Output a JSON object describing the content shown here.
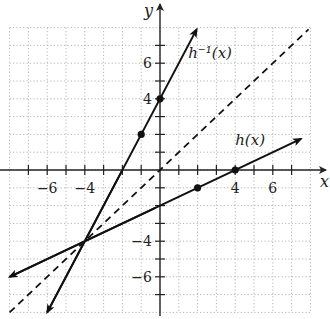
{
  "chart_data": {
    "type": "line",
    "title": "",
    "xlabel": "x",
    "ylabel": "y",
    "xlim": [
      -8,
      8
    ],
    "ylim": [
      -8,
      8
    ],
    "grid": true,
    "grid_style": "dotted",
    "x_ticks": [
      -6,
      -4,
      4,
      6
    ],
    "y_ticks": [
      6,
      4,
      -4,
      -6
    ],
    "series": [
      {
        "name": "h(x)",
        "label": "h(x)",
        "equation": "h(x) = x/2 - 2",
        "slope": 0.5,
        "intercept": -2,
        "style": "solid",
        "x_range": [
          -8,
          7.5
        ],
        "arrows": "both",
        "points": [
          {
            "x": 2,
            "y": -1
          },
          {
            "x": 4,
            "y": 0
          }
        ],
        "label_pos": {
          "x": 4,
          "y": 1.4
        }
      },
      {
        "name": "h^-1(x)",
        "label": "h⁻¹(x)",
        "equation": "h^-1(x) = 2x + 4",
        "slope": 2,
        "intercept": 4,
        "style": "solid",
        "x_range": [
          -6,
          1.95
        ],
        "arrows": "both",
        "points": [
          {
            "x": 0,
            "y": 4
          },
          {
            "x": -1,
            "y": 2
          }
        ],
        "label_pos": {
          "x": 1.5,
          "y": 6.3
        }
      },
      {
        "name": "y = x",
        "label": "",
        "equation": "y = x",
        "slope": 1,
        "intercept": 0,
        "style": "dashed",
        "x_range": [
          -8,
          7.9
        ],
        "arrows": "none",
        "points": []
      }
    ],
    "intersection": {
      "x": -4,
      "y": -4
    }
  }
}
